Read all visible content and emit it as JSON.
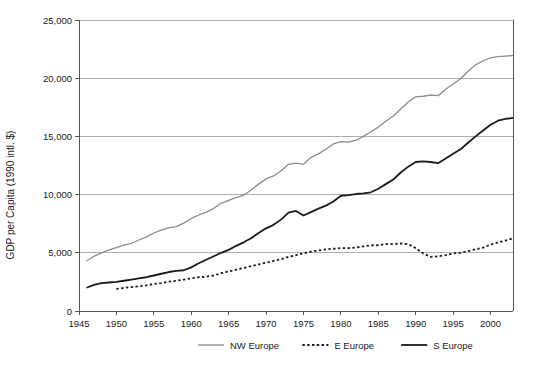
{
  "chart_data": {
    "type": "line",
    "title": "",
    "xlabel": "",
    "ylabel": "GDP per Capita (1990 intl. $)",
    "xlim": [
      1945,
      2003
    ],
    "ylim": [
      0,
      25000
    ],
    "grid": "horizontal",
    "legend_position": "bottom",
    "y_ticks": [
      0,
      5000,
      10000,
      15000,
      20000,
      25000
    ],
    "y_tick_labels": [
      "0",
      "5,000",
      "10,000",
      "15,000",
      "20,000",
      "25,000"
    ],
    "x_ticks": [
      1945,
      1950,
      1955,
      1960,
      1965,
      1970,
      1975,
      1980,
      1985,
      1990,
      1995,
      2000
    ],
    "x_tick_labels": [
      "1945",
      "1950",
      "1955",
      "1960",
      "1965",
      "1970",
      "1975",
      "1980",
      "1985",
      "1990",
      "1995",
      "2000"
    ],
    "series": [
      {
        "name": "NW Europe",
        "color": "#8c8c8c",
        "style": "solid",
        "width": 1.3,
        "x": [
          1946,
          1947,
          1948,
          1949,
          1950,
          1951,
          1952,
          1953,
          1954,
          1955,
          1956,
          1957,
          1958,
          1959,
          1960,
          1961,
          1962,
          1963,
          1964,
          1965,
          1966,
          1967,
          1968,
          1969,
          1970,
          1971,
          1972,
          1973,
          1974,
          1975,
          1976,
          1977,
          1978,
          1979,
          1980,
          1981,
          1982,
          1983,
          1984,
          1985,
          1986,
          1987,
          1988,
          1989,
          1990,
          1991,
          1992,
          1993,
          1994,
          1995,
          1996,
          1997,
          1998,
          1999,
          2000,
          2001,
          2002,
          2003
        ],
        "values": [
          4300,
          4700,
          5000,
          5250,
          5450,
          5650,
          5800,
          6100,
          6350,
          6700,
          6950,
          7150,
          7250,
          7550,
          7950,
          8250,
          8500,
          8800,
          9250,
          9500,
          9750,
          9950,
          10400,
          10900,
          11350,
          11600,
          12050,
          12600,
          12700,
          12600,
          13200,
          13500,
          13900,
          14350,
          14550,
          14500,
          14650,
          15000,
          15400,
          15800,
          16300,
          16750,
          17350,
          17950,
          18400,
          18450,
          18550,
          18500,
          19050,
          19500,
          19950,
          20600,
          21150,
          21500,
          21750,
          21850,
          21900,
          21950
        ]
      },
      {
        "name": "E Europe",
        "color": "#1a1a1a",
        "style": "dotted",
        "width": 1.8,
        "x": [
          1950,
          1951,
          1952,
          1953,
          1954,
          1955,
          1956,
          1957,
          1958,
          1959,
          1960,
          1961,
          1962,
          1963,
          1964,
          1965,
          1966,
          1967,
          1968,
          1969,
          1970,
          1971,
          1972,
          1973,
          1974,
          1975,
          1976,
          1977,
          1978,
          1979,
          1980,
          1981,
          1982,
          1983,
          1984,
          1985,
          1986,
          1987,
          1988,
          1989,
          1990,
          1991,
          1992,
          1993,
          1994,
          1995,
          1996,
          1997,
          1998,
          1999,
          2000,
          2001,
          2002,
          2003
        ],
        "values": [
          1900,
          1980,
          2050,
          2120,
          2200,
          2320,
          2400,
          2520,
          2600,
          2700,
          2800,
          2900,
          2950,
          3050,
          3250,
          3400,
          3550,
          3700,
          3850,
          4000,
          4150,
          4300,
          4450,
          4650,
          4800,
          4950,
          5100,
          5200,
          5300,
          5350,
          5400,
          5400,
          5450,
          5550,
          5650,
          5650,
          5750,
          5750,
          5800,
          5750,
          5400,
          4950,
          4650,
          4700,
          4800,
          4950,
          5000,
          5150,
          5300,
          5450,
          5700,
          5900,
          6050,
          6250
        ]
      },
      {
        "name": "S Europe",
        "color": "#1a1a1a",
        "style": "solid",
        "width": 1.8,
        "x": [
          1946,
          1947,
          1948,
          1949,
          1950,
          1951,
          1952,
          1953,
          1954,
          1955,
          1956,
          1957,
          1958,
          1959,
          1960,
          1961,
          1962,
          1963,
          1964,
          1965,
          1966,
          1967,
          1968,
          1969,
          1970,
          1971,
          1972,
          1973,
          1974,
          1975,
          1976,
          1977,
          1978,
          1979,
          1980,
          1981,
          1982,
          1983,
          1984,
          1985,
          1986,
          1987,
          1988,
          1989,
          1990,
          1991,
          1992,
          1993,
          1994,
          1995,
          1996,
          1997,
          1998,
          1999,
          2000,
          2001,
          2002,
          2003
        ],
        "values": [
          2000,
          2250,
          2400,
          2450,
          2500,
          2600,
          2700,
          2800,
          2900,
          3050,
          3200,
          3350,
          3450,
          3500,
          3750,
          4100,
          4400,
          4700,
          5000,
          5250,
          5600,
          5900,
          6250,
          6700,
          7100,
          7400,
          7850,
          8450,
          8600,
          8200,
          8500,
          8800,
          9050,
          9400,
          9900,
          9950,
          10050,
          10100,
          10200,
          10500,
          10900,
          11300,
          11900,
          12400,
          12800,
          12850,
          12800,
          12700,
          13100,
          13500,
          13900,
          14450,
          15000,
          15500,
          16000,
          16350,
          16500,
          16600
        ]
      }
    ]
  },
  "legend": {
    "items": [
      {
        "label": "NW Europe"
      },
      {
        "label": "E Europe"
      },
      {
        "label": "S Europe"
      }
    ]
  }
}
